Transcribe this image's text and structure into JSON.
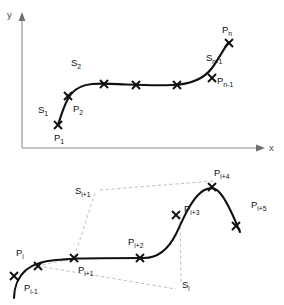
{
  "page": {
    "cropped_header_text": "",
    "background_color": "#ffffff",
    "curve_color": "#111111",
    "axis_color": "#8d8d8d",
    "dash_color": "#b4b4b4",
    "label_color": "#111111"
  },
  "figure_top": {
    "name": "global-spline-curve-diagram",
    "axes": {
      "y_label": "y",
      "x_label": "x"
    },
    "point_labels": [
      {
        "id": "p1",
        "base": "P",
        "sub": "1"
      },
      {
        "id": "p2",
        "base": "P",
        "sub": "2"
      },
      {
        "id": "pn1",
        "base": "P",
        "sub": "n-1"
      },
      {
        "id": "pn",
        "base": "P",
        "sub": "n"
      }
    ],
    "segment_labels": [
      {
        "id": "s1",
        "base": "S",
        "sub": "1"
      },
      {
        "id": "s2",
        "base": "S",
        "sub": "2"
      },
      {
        "id": "sn1",
        "base": "S",
        "sub": "n-1"
      }
    ],
    "marker_count": 7,
    "marker_glyph": "x"
  },
  "figure_bottom": {
    "name": "local-spline-segment-diagram",
    "point_labels": [
      {
        "id": "pim1",
        "base": "P",
        "sub": "i-1"
      },
      {
        "id": "pi",
        "base": "P",
        "sub": "i"
      },
      {
        "id": "pip1",
        "base": "P",
        "sub": "i+1"
      },
      {
        "id": "pip2",
        "base": "P",
        "sub": "i+2"
      },
      {
        "id": "pip3",
        "base": "P",
        "sub": "i+3"
      },
      {
        "id": "pip4",
        "base": "P",
        "sub": "i+4"
      },
      {
        "id": "pip5",
        "base": "P",
        "sub": "i+5"
      }
    ],
    "segment_labels": [
      {
        "id": "si",
        "base": "S",
        "sub": "i"
      },
      {
        "id": "sip1",
        "base": "S",
        "sub": "i+1"
      }
    ],
    "marker_count": 7,
    "marker_glyph": "x"
  }
}
